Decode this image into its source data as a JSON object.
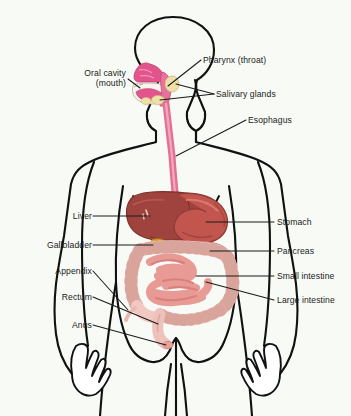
{
  "figure": {
    "background_color": "#f7faf5",
    "outline_color": "#111111",
    "leader_line_color": "#1a1a1a",
    "label_text_color": "#1a1a1a"
  },
  "labels_left": [
    {
      "id": "oral-cavity",
      "line1": "Oral cavity",
      "line2": "(mouth)",
      "x": 66,
      "y": 72,
      "width": 60
    },
    {
      "id": "liver",
      "text": "Liver",
      "x": 48,
      "y": 210,
      "width": 44
    },
    {
      "id": "gallbladder",
      "text": "Gallbladder",
      "x": 13,
      "y": 239,
      "width": 79
    },
    {
      "id": "appendix",
      "text": "Appendix",
      "x": 24,
      "y": 265,
      "width": 68
    },
    {
      "id": "rectum",
      "text": "Rectum",
      "x": 37,
      "y": 291,
      "width": 55
    },
    {
      "id": "anus",
      "text": "Anus",
      "x": 50,
      "y": 319,
      "width": 42
    }
  ],
  "labels_right": [
    {
      "id": "pharynx",
      "text": "Pharynx (throat)",
      "x": 203,
      "y": 54
    },
    {
      "id": "salivary-glands",
      "text": "Salivary glands",
      "x": 216,
      "y": 88
    },
    {
      "id": "esophagus",
      "text": "Esophagus",
      "x": 248,
      "y": 114
    },
    {
      "id": "stomach",
      "text": "Stomach",
      "x": 276,
      "y": 216
    },
    {
      "id": "pancreas",
      "text": "Pancreas",
      "x": 276,
      "y": 245
    },
    {
      "id": "small-intestine",
      "text": "Small intestine",
      "x": 276,
      "y": 270
    },
    {
      "id": "large-intestine",
      "text": "Large intestine",
      "x": 276,
      "y": 294
    }
  ],
  "organs": {
    "nasal_cavity_color": "#e2558c",
    "oral_cavity_color": "#f7f2e8",
    "tongue_color": "#e2558c",
    "salivary_gland_color": "#efe0a8",
    "pharynx_color": "#e8719b",
    "esophagus_color": "#e3708f",
    "liver_color": "#a0433f",
    "liver_shadow_color": "#8a3734",
    "stomach_color": "#c2564f",
    "stomach_highlight_color": "#d4726a",
    "gallbladder_color": "#d9a626",
    "pancreas_color": "#e8a9a0",
    "small_intestine_color": "#e89a95",
    "small_intestine_dark_color": "#d9807c",
    "large_intestine_color": "#f2c9c2",
    "rectum_color": "#eec2bb",
    "skin_outline_color": "#111111"
  }
}
